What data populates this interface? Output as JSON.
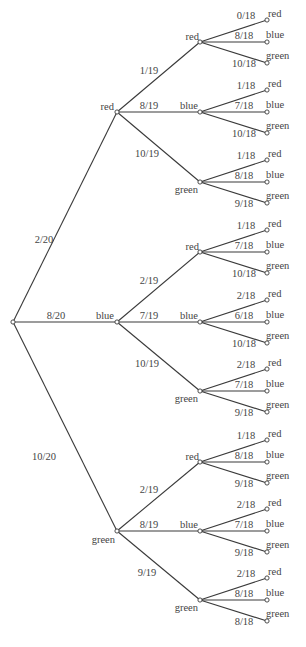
{
  "diagram": {
    "type": "probability-tree",
    "root": {
      "x": 13,
      "y": 322
    },
    "level1": [
      {
        "label": "red",
        "prob": "2/20",
        "x": 117,
        "y": 112,
        "children": [
          {
            "label": "red",
            "prob": "1/19",
            "y": 42,
            "leaves": [
              {
                "label": "red",
                "prob": "0/18"
              },
              {
                "label": "blue",
                "prob": "8/18"
              },
              {
                "label": "green",
                "prob": "10/18"
              }
            ]
          },
          {
            "label": "blue",
            "prob": "8/19",
            "y": 112,
            "leaves": [
              {
                "label": "red",
                "prob": "1/18"
              },
              {
                "label": "blue",
                "prob": "7/18"
              },
              {
                "label": "green",
                "prob": "10/18"
              }
            ]
          },
          {
            "label": "green",
            "prob": "10/19",
            "y": 182,
            "leaves": [
              {
                "label": "red",
                "prob": "1/18"
              },
              {
                "label": "blue",
                "prob": "8/18"
              },
              {
                "label": "green",
                "prob": "9/18"
              }
            ]
          }
        ]
      },
      {
        "label": "blue",
        "prob": "8/20",
        "x": 117,
        "y": 322,
        "children": [
          {
            "label": "red",
            "prob": "2/19",
            "y": 252,
            "leaves": [
              {
                "label": "red",
                "prob": "1/18"
              },
              {
                "label": "blue",
                "prob": "7/18"
              },
              {
                "label": "green",
                "prob": "10/18"
              }
            ]
          },
          {
            "label": "blue",
            "prob": "7/19",
            "y": 322,
            "leaves": [
              {
                "label": "red",
                "prob": "2/18"
              },
              {
                "label": "blue",
                "prob": "6/18"
              },
              {
                "label": "green",
                "prob": "10/18"
              }
            ]
          },
          {
            "label": "green",
            "prob": "10/19",
            "y": 391,
            "leaves": [
              {
                "label": "red",
                "prob": "2/18"
              },
              {
                "label": "blue",
                "prob": "7/18"
              },
              {
                "label": "green",
                "prob": "9/18"
              }
            ]
          }
        ]
      },
      {
        "label": "green",
        "prob": "10/20",
        "x": 117,
        "y": 531,
        "children": [
          {
            "label": "red",
            "prob": "2/19",
            "y": 462,
            "leaves": [
              {
                "label": "red",
                "prob": "1/18"
              },
              {
                "label": "blue",
                "prob": "8/18"
              },
              {
                "label": "green",
                "prob": "9/18"
              }
            ]
          },
          {
            "label": "blue",
            "prob": "8/19",
            "y": 531,
            "leaves": [
              {
                "label": "red",
                "prob": "2/18"
              },
              {
                "label": "blue",
                "prob": "7/18"
              },
              {
                "label": "green",
                "prob": "9/18"
              }
            ]
          },
          {
            "label": "green",
            "prob": "9/19",
            "y": 600,
            "leaves": [
              {
                "label": "red",
                "prob": "2/18"
              },
              {
                "label": "blue",
                "prob": "8/18"
              },
              {
                "label": "green",
                "prob": "8/18"
              }
            ]
          }
        ]
      }
    ],
    "level2_x": 200,
    "leaf_x": 267,
    "leaf_offsets": [
      -22,
      0,
      21
    ],
    "colors": {
      "line": "#3a3a3a",
      "text": "#444444"
    }
  }
}
